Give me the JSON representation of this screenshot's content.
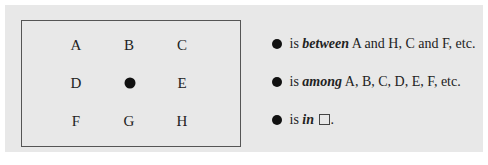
{
  "grid": {
    "rows": [
      [
        "A",
        "B",
        "C"
      ],
      [
        "D",
        "●",
        "E"
      ],
      [
        "F",
        "G",
        "H"
      ]
    ],
    "center_marker": "filled-circle"
  },
  "statements": [
    {
      "prefix": "is",
      "keyword": "between",
      "rest": "A and H, C and F, etc."
    },
    {
      "prefix": "is",
      "keyword": "among",
      "rest": "A, B, C, D, E, F, etc."
    },
    {
      "prefix": "is",
      "keyword": "in",
      "rest": "."
    }
  ]
}
